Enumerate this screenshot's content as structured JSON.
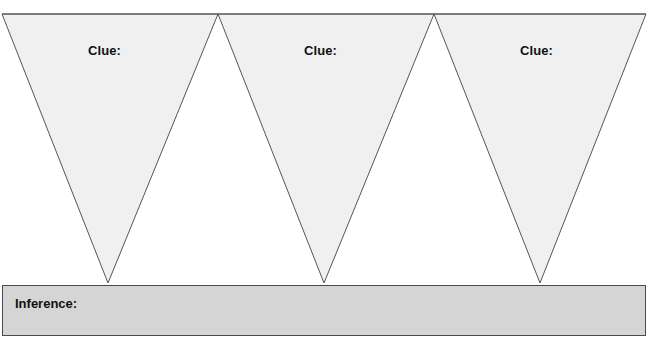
{
  "worksheet": {
    "title": "Clue and Inference Graphic Organizer",
    "width": 654,
    "height": 338,
    "background_color": "#ffffff"
  },
  "triangles": {
    "fill_color": "#f0f0f0",
    "stroke_color": "#555555",
    "stroke_width": 1,
    "top_edge_y": 14,
    "apex_y": 283,
    "items": [
      {
        "label": "Clue:",
        "apex_x": 108,
        "left_x": 2,
        "right_x": 218
      },
      {
        "label": "Clue:",
        "apex_x": 324,
        "left_x": 218,
        "right_x": 434
      },
      {
        "label": "Clue:",
        "apex_x": 540,
        "left_x": 434,
        "right_x": 646
      }
    ]
  },
  "inference": {
    "label": "Inference:",
    "fill_color": "#d5d5d5",
    "border_color": "#4a4a4a"
  }
}
